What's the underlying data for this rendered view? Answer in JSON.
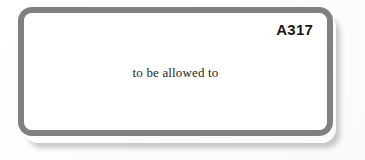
{
  "card": {
    "label": "A317",
    "text": "to be allowed to",
    "border_color": "#808080",
    "fill_color": "#ffffff",
    "label_color": "#171717",
    "text_color": "#1d1d1d"
  },
  "page": {
    "background_color": "#ffffff"
  }
}
